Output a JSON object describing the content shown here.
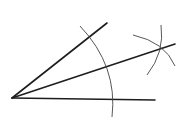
{
  "diagram": {
    "type": "angle-bisector-construction",
    "colors": {
      "background": "#ffffff",
      "ray": "#1e1e1e",
      "arc": "#444444"
    },
    "vertex": [
      12,
      98
    ],
    "rays": [
      {
        "name": "upper-ray",
        "from": [
          12,
          98
        ],
        "to": [
          107,
          23
        ]
      },
      {
        "name": "bisector-ray",
        "from": [
          12,
          98
        ],
        "to": [
          175,
          44
        ]
      },
      {
        "name": "base-ray",
        "from": [
          12,
          98
        ],
        "to": [
          155,
          100
        ]
      }
    ],
    "arcs": [
      {
        "name": "main-arc",
        "path": "M 80 26 Q 118 66 112 117"
      },
      {
        "name": "upper-intersect-arc",
        "path": "M 133 35 Q 165 42 175 66"
      },
      {
        "name": "lower-intersect-arc",
        "path": "M 161 25 Q 165 52 147 75"
      }
    ],
    "intersection_point": [
      160,
      49
    ]
  }
}
